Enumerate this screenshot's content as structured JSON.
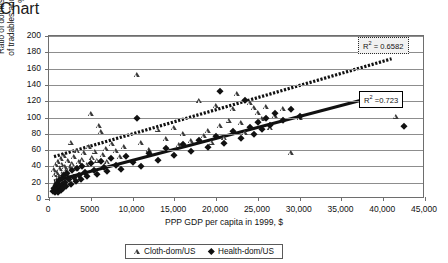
{
  "chart_data": {
    "type": "scatter",
    "title": "",
    "xlabel": "PPP GDP per capita in 1999, $",
    "ylabel": "Ratio of domestic to US prices of tradables and non-tradables, %",
    "xlim": [
      0,
      45000
    ],
    "ylim": [
      0,
      200
    ],
    "xticks": [
      0,
      5000,
      10000,
      15000,
      20000,
      25000,
      30000,
      35000,
      40000,
      45000
    ],
    "xticklabels": [
      "0",
      "5000",
      "10,000",
      "15,000",
      "20,000",
      "25,000",
      "30,000",
      "35,000",
      "40,000",
      "45,000"
    ],
    "yticks": [
      0,
      20,
      40,
      60,
      80,
      100,
      120,
      140,
      160,
      180,
      200
    ],
    "yticklabels": [
      "0",
      "20",
      "40",
      "60",
      "80",
      "100",
      "120",
      "140",
      "160",
      "180",
      "200"
    ],
    "grid": "horizontal",
    "legend_position": "below-axis",
    "series": [
      {
        "name": "Cloth-dom/US",
        "marker": "open-triangle",
        "color": "#3a3a3a",
        "points": [
          [
            600,
            34
          ],
          [
            700,
            28
          ],
          [
            800,
            40
          ],
          [
            900,
            22
          ],
          [
            1000,
            31
          ],
          [
            1100,
            44
          ],
          [
            1200,
            26
          ],
          [
            1300,
            36
          ],
          [
            1400,
            48
          ],
          [
            1500,
            30
          ],
          [
            1600,
            41
          ],
          [
            1700,
            25
          ],
          [
            1800,
            52
          ],
          [
            1900,
            38
          ],
          [
            2000,
            33
          ],
          [
            2100,
            29
          ],
          [
            2300,
            45
          ],
          [
            2500,
            37
          ],
          [
            2600,
            68
          ],
          [
            2800,
            42
          ],
          [
            3000,
            50
          ],
          [
            3200,
            35
          ],
          [
            3400,
            58
          ],
          [
            3600,
            44
          ],
          [
            3800,
            39
          ],
          [
            4000,
            47
          ],
          [
            4200,
            55
          ],
          [
            4500,
            41
          ],
          [
            4800,
            62
          ],
          [
            5000,
            103
          ],
          [
            5200,
            49
          ],
          [
            5500,
            57
          ],
          [
            5800,
            46
          ],
          [
            6000,
            88
          ],
          [
            6200,
            81
          ],
          [
            6500,
            53
          ],
          [
            6800,
            60
          ],
          [
            7000,
            44
          ],
          [
            7500,
            66
          ],
          [
            8000,
            58
          ],
          [
            8500,
            50
          ],
          [
            9000,
            63
          ],
          [
            10500,
            151
          ],
          [
            11000,
            67
          ],
          [
            12000,
            59
          ],
          [
            13000,
            84
          ],
          [
            14000,
            72
          ],
          [
            15000,
            86
          ],
          [
            15500,
            65
          ],
          [
            16000,
            78
          ],
          [
            17000,
            70
          ],
          [
            18000,
            119
          ],
          [
            18500,
            76
          ],
          [
            19000,
            82
          ],
          [
            19500,
            68
          ],
          [
            20000,
            113
          ],
          [
            20500,
            88
          ],
          [
            21000,
            74
          ],
          [
            21500,
            95
          ],
          [
            22000,
            109
          ],
          [
            22500,
            127
          ],
          [
            23000,
            92
          ],
          [
            23500,
            80
          ],
          [
            24000,
            117
          ],
          [
            24500,
            110
          ],
          [
            25000,
            104
          ],
          [
            25500,
            97
          ],
          [
            26000,
            112
          ],
          [
            26500,
            86
          ],
          [
            27000,
            101
          ],
          [
            28000,
            109
          ],
          [
            29000,
            55
          ],
          [
            30000,
            98
          ],
          [
            41500,
            100
          ]
        ]
      },
      {
        "name": "Health-dom/US",
        "marker": "filled-diamond",
        "color": "#111111",
        "points": [
          [
            500,
            10
          ],
          [
            600,
            14
          ],
          [
            700,
            8
          ],
          [
            800,
            17
          ],
          [
            900,
            12
          ],
          [
            1000,
            20
          ],
          [
            1100,
            9
          ],
          [
            1200,
            23
          ],
          [
            1300,
            15
          ],
          [
            1400,
            11
          ],
          [
            1500,
            26
          ],
          [
            1600,
            18
          ],
          [
            1700,
            13
          ],
          [
            1800,
            29
          ],
          [
            1900,
            21
          ],
          [
            2000,
            16
          ],
          [
            2200,
            32
          ],
          [
            2400,
            24
          ],
          [
            2600,
            19
          ],
          [
            2800,
            35
          ],
          [
            3000,
            27
          ],
          [
            3200,
            22
          ],
          [
            3400,
            38
          ],
          [
            3600,
            30
          ],
          [
            3800,
            25
          ],
          [
            4000,
            41
          ],
          [
            4300,
            33
          ],
          [
            4600,
            28
          ],
          [
            5000,
            44
          ],
          [
            5400,
            36
          ],
          [
            5800,
            31
          ],
          [
            6200,
            47
          ],
          [
            6600,
            39
          ],
          [
            7000,
            34
          ],
          [
            7400,
            50
          ],
          [
            8000,
            42
          ],
          [
            8600,
            37
          ],
          [
            9200,
            53
          ],
          [
            10000,
            45
          ],
          [
            10500,
            100
          ],
          [
            11000,
            40
          ],
          [
            12000,
            56
          ],
          [
            13000,
            48
          ],
          [
            14000,
            62
          ],
          [
            15000,
            54
          ],
          [
            16000,
            67
          ],
          [
            17000,
            59
          ],
          [
            18000,
            72
          ],
          [
            19000,
            64
          ],
          [
            20000,
            77
          ],
          [
            20500,
            133
          ],
          [
            21000,
            69
          ],
          [
            22000,
            83
          ],
          [
            23000,
            75
          ],
          [
            23500,
            122
          ],
          [
            24000,
            88
          ],
          [
            24500,
            80
          ],
          [
            25000,
            94
          ],
          [
            25500,
            86
          ],
          [
            26000,
            99
          ],
          [
            26500,
            91
          ],
          [
            27000,
            105
          ],
          [
            28000,
            97
          ],
          [
            29000,
            110
          ],
          [
            30000,
            102
          ],
          [
            42500,
            90
          ]
        ]
      }
    ],
    "trendlines": [
      {
        "name": "Cloth-dom/US trendline",
        "style": "dotted-thick",
        "x_start": 600,
        "y_start": 52,
        "x_end": 41000,
        "y_end": 172,
        "r_squared_label": "0.6582"
      },
      {
        "name": "Health-dom/US trendline",
        "style": "solid-thick",
        "x_start": 600,
        "y_start": 22,
        "x_end": 41000,
        "y_end": 131,
        "r_squared_label": "0.723"
      }
    ],
    "annotations": [
      {
        "name": "r2-cloth",
        "text_prefix": "R",
        "text_sup": "2",
        "text_suffix": " = 0.6582"
      },
      {
        "name": "r2-health",
        "text_prefix": "R",
        "text_sup": "2",
        "text_suffix": " =0.723"
      }
    ]
  },
  "legend": {
    "items": [
      {
        "label": "Cloth-dom/US",
        "marker": "open-triangle-icon"
      },
      {
        "label": "Health-dom/US",
        "marker": "filled-diamond-icon"
      }
    ]
  }
}
